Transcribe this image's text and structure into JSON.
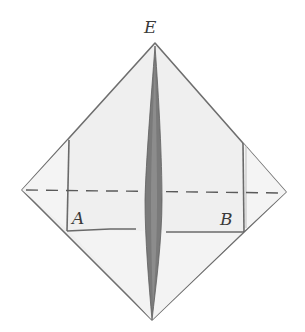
{
  "diagram": {
    "type": "origami-fold-step",
    "labels": {
      "apex": "E",
      "left_corner": "A",
      "right_corner": "B"
    },
    "colors": {
      "paper": "#efefef",
      "paper_shadow": "#e2e2e2",
      "outline": "#6e6e6e",
      "center_fold": "#7a7a7a",
      "center_fold_dark": "#5e5e5e",
      "dashed_line": "#5a5a5a",
      "label": "#3a3a3a"
    },
    "elements": [
      "diamond-base",
      "left-flap",
      "right-flap",
      "center-spindle-fold",
      "horizontal-dashed-valley-fold-line",
      "flap-bottom-edge"
    ]
  }
}
